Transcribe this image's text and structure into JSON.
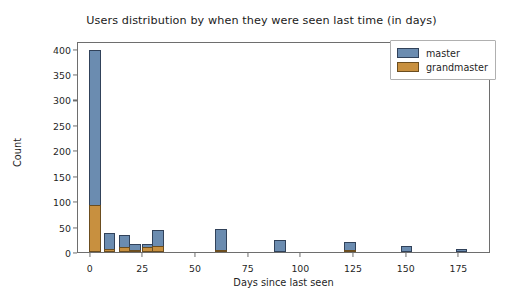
{
  "chart_data": {
    "type": "bar",
    "title": "Users distribution by when they were seen last time (in days)",
    "xlabel": "Days since last seen",
    "ylabel": "Count",
    "xlim": [
      -6,
      190
    ],
    "ylim": [
      0,
      415
    ],
    "grid": false,
    "legend_position": "upper right",
    "xticks": [
      0,
      25,
      50,
      75,
      100,
      125,
      150,
      175
    ],
    "yticks": [
      0,
      50,
      100,
      150,
      200,
      250,
      300,
      350,
      400
    ],
    "bin_width": 5.5,
    "series": [
      {
        "name": "master",
        "color": "#6b8cb0",
        "x": [
          2,
          9,
          16,
          21,
          27,
          32,
          62,
          90,
          123,
          150,
          176
        ],
        "values": [
          397,
          38,
          33,
          15,
          15,
          44,
          45,
          23,
          20,
          11,
          6
        ]
      },
      {
        "name": "grandmaster",
        "color": "#c8903f",
        "x": [
          2,
          9,
          16,
          21,
          27,
          32,
          62,
          90,
          123,
          150,
          176
        ],
        "values": [
          93,
          5,
          9,
          4,
          10,
          11,
          3,
          0,
          4,
          0,
          0
        ]
      }
    ]
  },
  "legend": {
    "entries": [
      {
        "label": "master"
      },
      {
        "label": "grandmaster"
      }
    ]
  }
}
